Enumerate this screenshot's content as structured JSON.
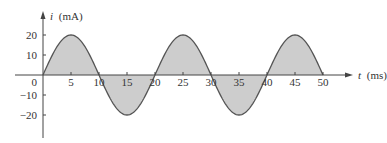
{
  "chart_data": {
    "type": "area",
    "title": "",
    "xlabel": "t (ms)",
    "ylabel": "i (mA)",
    "xlabel_var": "t",
    "xlabel_unit": "(ms)",
    "ylabel_var": "i",
    "ylabel_unit": "(mA)",
    "function": "i(t) = 20 sin(2π·50·t) mA, t in seconds (period 20 ms)",
    "amplitude": 20,
    "period_ms": 20,
    "xlim": [
      0,
      50
    ],
    "ylim": [
      -20,
      20
    ],
    "x_ticks": [
      5,
      10,
      15,
      20,
      25,
      30,
      35,
      40,
      45,
      50
    ],
    "x_tick_labels": [
      "5",
      "10",
      "15",
      "20",
      "25",
      "30",
      "35",
      "40",
      "45",
      "50"
    ],
    "y_ticks": [
      20,
      10,
      0,
      -10,
      -20
    ],
    "y_tick_labels": [
      "20",
      "10",
      "0",
      "−10",
      "−20"
    ],
    "x": [
      0,
      2.5,
      5,
      7.5,
      10,
      12.5,
      15,
      17.5,
      20,
      22.5,
      25,
      27.5,
      30,
      32.5,
      35,
      37.5,
      40,
      42.5,
      45,
      47.5,
      50
    ],
    "series": [
      {
        "name": "i(t)",
        "values": [
          0,
          14.1,
          20,
          14.1,
          0,
          -14.1,
          -20,
          -14.1,
          0,
          14.1,
          20,
          14.1,
          0,
          -14.1,
          -20,
          -14.1,
          0,
          14.1,
          20,
          14.1,
          0
        ],
        "fill": "#cccccc",
        "stroke": "#555555"
      }
    ],
    "grid": false,
    "legend": "none"
  },
  "colors": {
    "axis": "#444444",
    "curve": "#555555",
    "fill": "#cdcdcd",
    "text": "#333333"
  }
}
